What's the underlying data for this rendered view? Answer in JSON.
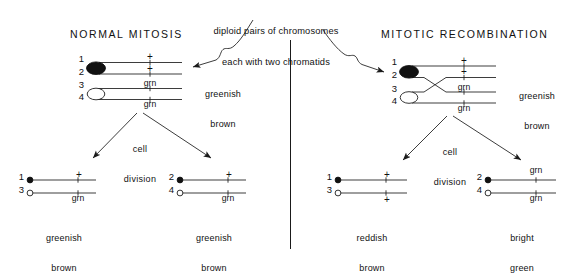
{
  "figure": {
    "annotation": {
      "line1": "diploid pairs of chromosomes",
      "line2": "each with two chromatids"
    },
    "divider": "vertical-rule"
  },
  "panels": [
    {
      "id": "normal-mitosis",
      "title": "NORMAL MITOSIS",
      "parent": {
        "phenotype_line1": "greenish",
        "phenotype_line2": "brown",
        "chromatids": [
          {
            "num": "1",
            "allele": "+",
            "centromere": "filled"
          },
          {
            "num": "2",
            "allele": "+",
            "centromere": "filled"
          },
          {
            "num": "3",
            "allele": "grn",
            "centromere": "open"
          },
          {
            "num": "4",
            "allele": "grn",
            "centromere": "open"
          }
        ]
      },
      "division_label_line1": "cell",
      "division_label_line2": "division",
      "daughters": [
        {
          "id": "left-daughter",
          "phenotype_line1": "greenish",
          "phenotype_line2": "brown",
          "chromatids": [
            {
              "num": "1",
              "allele": "+",
              "centromere": "filled"
            },
            {
              "num": "3",
              "allele": "grn",
              "centromere": "open"
            }
          ]
        },
        {
          "id": "right-daughter",
          "phenotype_line1": "greenish",
          "phenotype_line2": "brown",
          "chromatids": [
            {
              "num": "2",
              "allele": "+",
              "centromere": "filled"
            },
            {
              "num": "4",
              "allele": "grn",
              "centromere": "open"
            }
          ]
        }
      ]
    },
    {
      "id": "mitotic-recombination",
      "title": "MITOTIC RECOMBINATION",
      "parent": {
        "phenotype_line1": "greenish",
        "phenotype_line2": "brown",
        "chromatids": [
          {
            "num": "1",
            "allele": "+",
            "centromere": "filled"
          },
          {
            "num": "2",
            "allele": "+",
            "centromere": "filled"
          },
          {
            "num": "3",
            "allele": "grn",
            "centromere": "open"
          },
          {
            "num": "4",
            "allele": "grn",
            "centromere": "open"
          }
        ],
        "crossover_between": "2 and 3"
      },
      "division_label_line1": "cell",
      "division_label_line2": "division",
      "daughters": [
        {
          "id": "left-daughter",
          "phenotype_line1": "reddish",
          "phenotype_line2": "brown",
          "chromatids": [
            {
              "num": "1",
              "allele": "+",
              "centromere": "filled"
            },
            {
              "num": "3",
              "allele": "+",
              "centromere": "open"
            }
          ]
        },
        {
          "id": "right-daughter",
          "phenotype_line1": "bright",
          "phenotype_line2": "green",
          "chromatids": [
            {
              "num": "2",
              "allele": "grn",
              "centromere": "filled"
            },
            {
              "num": "4",
              "allele": "grn",
              "centromere": "open"
            }
          ]
        }
      ]
    }
  ]
}
